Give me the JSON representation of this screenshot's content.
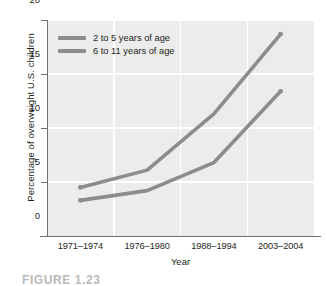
{
  "chart_data": {
    "type": "line",
    "title": "",
    "xlabel": "Year",
    "ylabel": "Percentage of overweight U.S. children",
    "categories": [
      "1971–1974",
      "1976–1980",
      "1988–1994",
      "2003–2004"
    ],
    "series": [
      {
        "name": "2 to 5 years of age",
        "color": "#8c8c8c",
        "values": [
          4.5,
          6.1,
          11.3,
          18.7
        ]
      },
      {
        "name": "6 to 11 years of age",
        "color": "#8c8c8c",
        "values": [
          3.3,
          4.2,
          6.8,
          13.4
        ]
      }
    ],
    "ylim": [
      0,
      20
    ],
    "yticks": [
      0,
      5,
      10,
      15,
      20
    ],
    "ytick_labels": [
      "0",
      "5",
      "10",
      "15",
      "20"
    ],
    "grid": true,
    "legend_position": "top-left",
    "plot_background": "#ececec",
    "gridline_color": "#ffffff",
    "axis_color": "#6e6e6e"
  },
  "caption": {
    "text": "FIGURE 1.23"
  }
}
